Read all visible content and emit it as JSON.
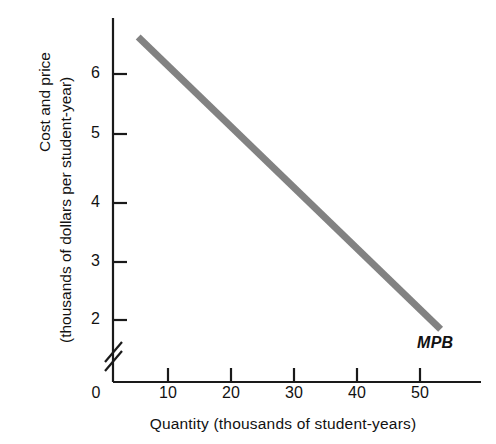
{
  "chart_data": {
    "type": "line",
    "title": "",
    "xlabel": "Quantity (thousands of student-years)",
    "ylabel_line1": "Cost and price",
    "ylabel_line2": "(thousands of dollars per student-year)",
    "xlim": [
      0,
      58
    ],
    "ylim": [
      1.55,
      7.1
    ],
    "y_axis_break": true,
    "y_axis_break_note": "axis broken between 0 and 2",
    "grid": false,
    "legend_position": "inline-end-of-line",
    "xticks": [
      10,
      20,
      30,
      40,
      50
    ],
    "xtick_labels": [
      "10",
      "20",
      "30",
      "40",
      "50"
    ],
    "origin_label": "0",
    "yticks": [
      2,
      3,
      4,
      5,
      6
    ],
    "ytick_labels": [
      "2",
      "3",
      "4",
      "5",
      "6"
    ],
    "series": [
      {
        "name": "MPB",
        "label": "MPB",
        "color": "#828282",
        "linewidth": 7,
        "x": [
          4,
          52
        ],
        "values": [
          6.6,
          1.85
        ],
        "points": [
          {
            "x": 4,
            "y": 6.6
          },
          {
            "x": 10,
            "y": 6.0
          },
          {
            "x": 20,
            "y": 5.0
          },
          {
            "x": 30,
            "y": 4.0
          },
          {
            "x": 40,
            "y": 3.0
          },
          {
            "x": 50,
            "y": 2.0
          },
          {
            "x": 52,
            "y": 1.85
          }
        ]
      }
    ],
    "annotations": [
      {
        "text": "MPB",
        "x": 51,
        "y": 1.5,
        "style": "italic"
      }
    ]
  },
  "axes": {
    "axis_color": "#1a1a1a",
    "axis_linewidth": 2
  }
}
